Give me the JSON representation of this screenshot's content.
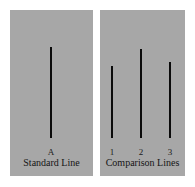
{
  "diagram": {
    "background_color": "#ffffff",
    "panel_color": "#a7a7a7",
    "line_color": "#0b0b0b",
    "panels": [
      {
        "id": "standard",
        "caption": "Standard Line",
        "lines": [
          {
            "label": "A",
            "relative_height": 91
          }
        ]
      },
      {
        "id": "comparison",
        "caption": "Comparison Lines",
        "lines": [
          {
            "label": "1",
            "relative_height": 72
          },
          {
            "label": "2",
            "relative_height": 89
          },
          {
            "label": "3",
            "relative_height": 76
          }
        ]
      }
    ]
  }
}
